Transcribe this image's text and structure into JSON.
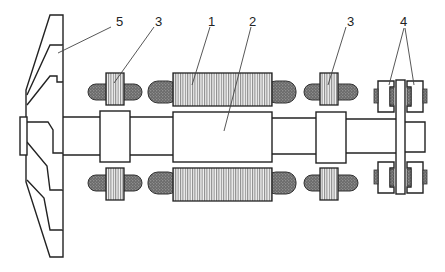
{
  "diagram": {
    "title": "",
    "background": "#ffffff",
    "line_color": "#222222",
    "labels": [
      {
        "id": "1",
        "text": "1",
        "x": 212,
        "y": 21,
        "points_to": "main-magnet-core"
      },
      {
        "id": "2",
        "text": "2",
        "x": 253,
        "y": 21,
        "points_to": "central-rotor-hub"
      },
      {
        "id": "3a",
        "text": "3",
        "x": 157,
        "y": 21,
        "points_to": "left-small-magnet"
      },
      {
        "id": "3b",
        "text": "3",
        "x": 350,
        "y": 21,
        "points_to": "right-small-magnet"
      },
      {
        "id": "4",
        "text": "4",
        "x": 404,
        "y": 21,
        "points_to": "disc-brake-pads"
      },
      {
        "id": "5",
        "text": "5",
        "x": 119,
        "y": 21,
        "points_to": "impeller-wheel"
      }
    ],
    "components": [
      {
        "name": "impeller-wheel",
        "label": "5"
      },
      {
        "name": "main-magnet-core",
        "label": "1",
        "fill": "hatched-vertical"
      },
      {
        "name": "central-rotor-hub",
        "label": "2"
      },
      {
        "name": "small-magnet",
        "label": "3",
        "count": 2,
        "fill": "hatched-vertical"
      },
      {
        "name": "disc-brake-pads",
        "label": "4",
        "count": 2
      },
      {
        "name": "coil-winding",
        "fill": "dark-stipple",
        "color": "#555555"
      },
      {
        "name": "shaft"
      },
      {
        "name": "brake-disc"
      }
    ]
  }
}
